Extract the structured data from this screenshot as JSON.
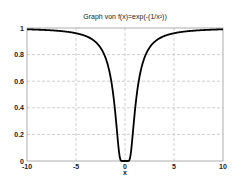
{
  "chart_data": {
    "type": "line",
    "title": "Graph von f(x)=exp(-(1/x²))",
    "xlabel": "x",
    "ylabel": "",
    "xlim": [
      -10,
      10
    ],
    "ylim": [
      0,
      1
    ],
    "xticks": [
      "-10",
      "-5",
      "0",
      "5",
      "10"
    ],
    "yticks": [
      "0",
      "0.2",
      "0.4",
      "0.6",
      "0.8",
      "1"
    ],
    "grid": true,
    "series": [
      {
        "name": "f(x)=exp(-(1/x^2))",
        "color": "#000000",
        "x": [
          -10,
          -8,
          -6,
          -5,
          -4,
          -3,
          -2.5,
          -2,
          -1.5,
          -1.2,
          -1,
          -0.8,
          -0.6,
          -0.5,
          -0.4,
          0,
          0.4,
          0.5,
          0.6,
          0.8,
          1,
          1.2,
          1.5,
          2,
          2.5,
          3,
          4,
          5,
          6,
          8,
          10
        ],
        "y": [
          0.99,
          0.984,
          0.973,
          0.961,
          0.939,
          0.895,
          0.852,
          0.779,
          0.641,
          0.499,
          0.368,
          0.21,
          0.062,
          0.018,
          0.002,
          0,
          0.002,
          0.018,
          0.062,
          0.21,
          0.368,
          0.499,
          0.641,
          0.779,
          0.852,
          0.895,
          0.939,
          0.961,
          0.973,
          0.984,
          0.99
        ]
      }
    ]
  }
}
